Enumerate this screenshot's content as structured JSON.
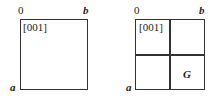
{
  "diagrams": [
    {
      "origin_label": "0",
      "b_label": "b",
      "a_label": "a",
      "direction_label": "[001]"
    },
    {
      "origin_label": "0",
      "b_label": "b",
      "a_label": "a",
      "direction_label": "[001]",
      "quadrant_label": "G"
    }
  ]
}
